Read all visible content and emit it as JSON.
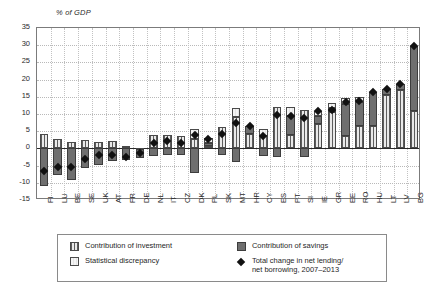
{
  "axis_title": "% of GDP",
  "legend": {
    "items": [
      {
        "key": "investment",
        "label": "Contribution of investment",
        "swatch": "pinstripe-square-icon"
      },
      {
        "key": "savings",
        "label": "Contribution of savings",
        "swatch": "solid-grey-square-icon"
      },
      {
        "key": "discrepancy",
        "label": "Statistical discrepancy",
        "swatch": "light-dotted-square-icon"
      },
      {
        "key": "total",
        "label": "Total change in net lending/\nnet borrowing, 2007–2013",
        "swatch": "black-diamond-icon"
      }
    ]
  },
  "chart_data": {
    "type": "bar",
    "title": "",
    "subtitle": "",
    "xlabel": "",
    "ylabel": "% of GDP",
    "ylim": [
      -15,
      35
    ],
    "ytick_step": 5,
    "yticks": [
      35,
      30,
      25,
      20,
      15,
      10,
      5,
      0,
      -5,
      -10,
      -15
    ],
    "grid": true,
    "legend_position": "bottom",
    "stacked": true,
    "categories": [
      "FI",
      "LU",
      "BE",
      "SE",
      "UK",
      "AT",
      "FR",
      "DE",
      "NL",
      "IT",
      "CZ",
      "DK",
      "PL",
      "SK",
      "MT",
      "HR",
      "CY",
      "ES",
      "PT",
      "SI",
      "IE",
      "GR",
      "EE",
      "RO",
      "HU",
      "LT",
      "LV",
      "BG"
    ],
    "series": [
      {
        "name": "Contribution of investment",
        "values": [
          4.2,
          2.6,
          2.0,
          2.5,
          1.9,
          2.1,
          0.8,
          -0.3,
          3.9,
          3.9,
          3.6,
          2.7,
          0.6,
          6.2,
          9.0,
          4.3,
          3.6,
          12.1,
          4.0,
          11.2,
          7.0,
          10.6,
          3.6,
          6.6,
          6.4,
          15.6,
          17.0,
          11.0
        ]
      },
      {
        "name": "Contribution of savings",
        "values": [
          -11.0,
          -7.8,
          -9.2,
          -5.7,
          -4.7,
          -3.8,
          -3.5,
          -2.4,
          -2.1,
          -1.8,
          -2.0,
          -7.2,
          1.1,
          -2.0,
          -3.9,
          2.3,
          -2.1,
          -2.4,
          5.3,
          -2.4,
          2.5,
          1.2,
          9.2,
          7.0,
          9.9,
          1.6,
          1.6,
          18.8
        ]
      },
      {
        "name": "Statistical discrepancy",
        "values": [
          0.0,
          0.0,
          0.0,
          0.0,
          0.0,
          0.0,
          0.0,
          0.0,
          0.0,
          0.0,
          0.0,
          2.8,
          1.2,
          0.0,
          2.6,
          0.0,
          2.1,
          0.0,
          2.6,
          0.0,
          1.5,
          1.3,
          1.8,
          1.4,
          0.0,
          0.0,
          0.0,
          0.0
        ]
      }
    ],
    "markers": {
      "name": "Total change in net lending/net borrowing, 2007–2013",
      "style": "black-diamond",
      "values": [
        -6.6,
        -5.4,
        -5.4,
        -3.0,
        -2.0,
        -1.8,
        -2.5,
        -1.3,
        1.7,
        2.1,
        1.5,
        4.0,
        2.6,
        4.2,
        7.5,
        6.6,
        3.6,
        9.8,
        9.5,
        8.8,
        11.0,
        11.3,
        13.6,
        13.8,
        16.3,
        17.2,
        18.6,
        29.8
      ]
    }
  }
}
